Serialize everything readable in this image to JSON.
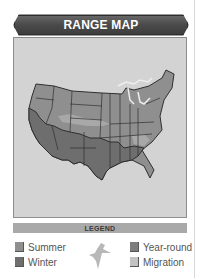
{
  "header": {
    "title": "RANGE MAP"
  },
  "map": {
    "region": "Contiguous United States",
    "icon": "us-map"
  },
  "legend": {
    "title": "LEGEND",
    "items": [
      {
        "label": "Summer",
        "color": "#8f8f8f"
      },
      {
        "label": "Winter",
        "color": "#6e6e6e"
      },
      {
        "label": "Year-round",
        "color": "#7d7d7d"
      },
      {
        "label": "Migration",
        "color": "#c2c2c2"
      }
    ],
    "bird_icon": "bird-silhouette-icon"
  },
  "colors": {
    "banner": "#4a4a4a",
    "panel_bg": "#d3d3d3",
    "legend_bar": "#a9a9a9"
  }
}
